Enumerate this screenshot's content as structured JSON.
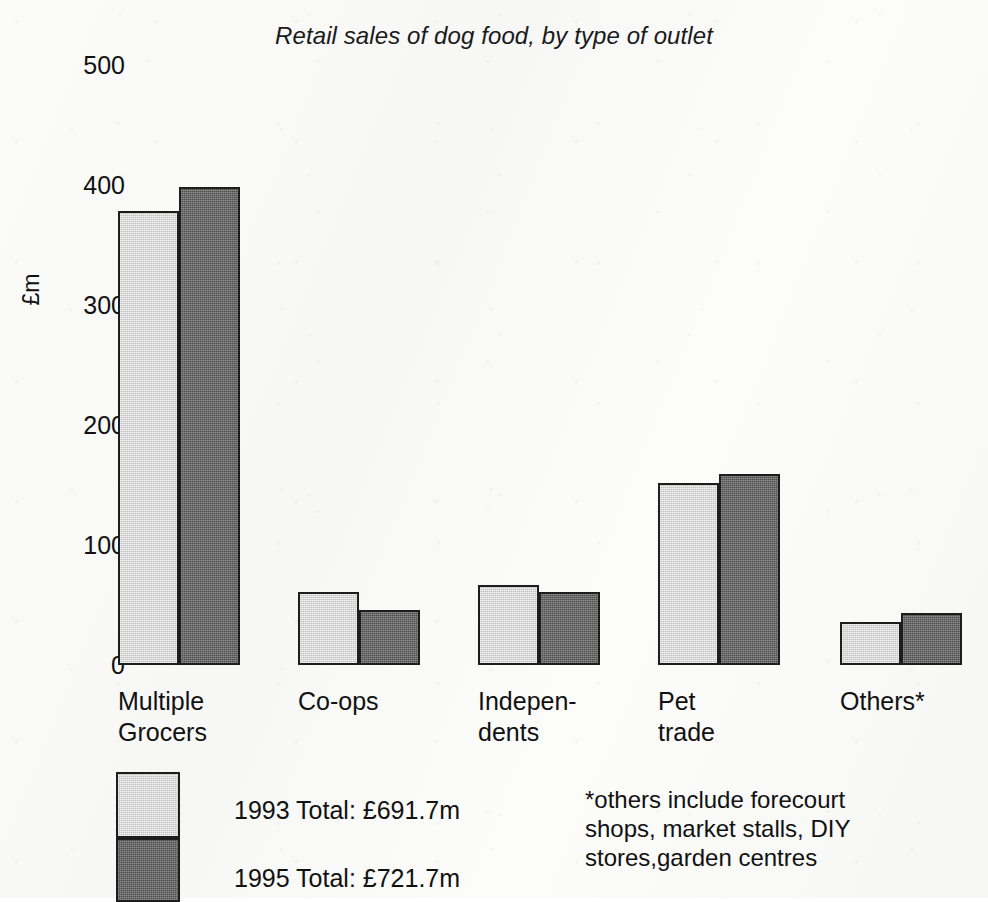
{
  "chart_data": {
    "type": "bar",
    "title": "Retail sales of dog food, by type of outlet",
    "xlabel": "",
    "ylabel": "£m",
    "ylim": [
      0,
      500
    ],
    "ytick_labels": [
      "500",
      "400",
      "300",
      "200",
      "100",
      "0"
    ],
    "ytick_values": [
      500,
      400,
      300,
      200,
      100,
      0
    ],
    "grid": false,
    "legend_position": "bottom-left",
    "categories": [
      "Multiple\nGrocers",
      "Co-ops",
      "Indepen-\ndents",
      "Pet\ntrade",
      "Others*"
    ],
    "series": [
      {
        "name": "1993 Total: £691.7m",
        "year": "1993",
        "color": "#d3d3d3",
        "values": [
          378,
          61,
          67,
          152,
          36
        ]
      },
      {
        "name": "1995 Total: £721.7m",
        "year": "1995",
        "color": "#696969",
        "values": [
          398,
          46,
          61,
          159,
          43
        ]
      }
    ],
    "annotations": [
      "*others include forecourt\nshops, market stalls, DIY\nstores,garden centres"
    ]
  },
  "legend": {
    "items": [
      {
        "label": "1993 Total: £691.7m"
      },
      {
        "label": "1995 Total: £721.7m"
      }
    ]
  },
  "footnote": {
    "text": "*others include forecourt\nshops, market stalls, DIY\nstores,garden centres"
  },
  "colors": {
    "series_1993": "#d3d3d3",
    "series_1995": "#696969",
    "outline": "#1d1d1d",
    "background": "#fbfbfa",
    "text": "#111111"
  }
}
